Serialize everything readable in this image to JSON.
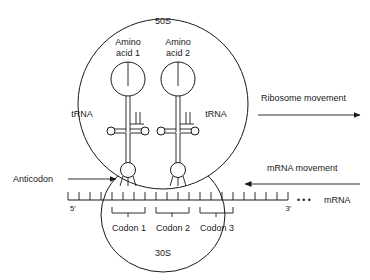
{
  "figure": {
    "subunits": {
      "large": "50S",
      "small": "30S"
    },
    "amino_acids": [
      {
        "line1": "Amino",
        "line2": "acid 1"
      },
      {
        "line1": "Amino",
        "line2": "acid 2"
      }
    ],
    "trna_labels": [
      "tRNA",
      "tRNA"
    ],
    "anticodon_label": "Anticodon",
    "mrna": {
      "label": "mRNA",
      "five_prime": "5′",
      "three_prime": "3′",
      "continuation": "• • •",
      "tick_count": 19
    },
    "codons": [
      "Codon 1",
      "Codon 2",
      "Codon 3"
    ],
    "movement_arrows": [
      {
        "label": "Ribosome movement",
        "direction": "right"
      },
      {
        "label": "mRNA movement",
        "direction": "left"
      }
    ],
    "colors": {
      "stroke": "#1a1a1a",
      "fill": "#ffffff",
      "background": "#ffffff"
    }
  }
}
